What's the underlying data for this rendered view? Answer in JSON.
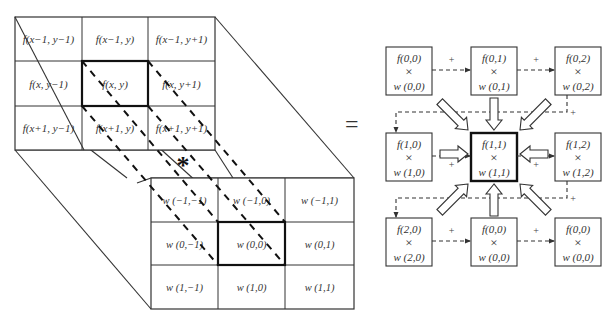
{
  "diagram": {
    "colors": {
      "line": "#333333",
      "text": "#333333",
      "background": "#ffffff"
    },
    "image_grid": {
      "rows": [
        [
          "f(x−1, y−1)",
          "f(x−1, y)",
          "f(x−1, y+1)"
        ],
        [
          "f(x, y−1)",
          "f(x, y)",
          "f(x, y+1)"
        ],
        [
          "f(x+1, y−1)",
          "f(x+1, y)",
          "f(x+1, y+1)"
        ]
      ],
      "highlighted_cell": "f(x, y)"
    },
    "kernel_grid": {
      "rows": [
        [
          "w (−1,−1)",
          "w (−1,0)",
          "w (−1,1)"
        ],
        [
          "w (0,−1)",
          "w (0,0)",
          "w (0,1)"
        ],
        [
          "w (1,−1)",
          "w (1,0)",
          "w (1,1)"
        ]
      ],
      "highlighted_cell": "w (0,0)"
    },
    "operator_symbol": "*",
    "equals_symbol": "=",
    "plus_symbol": "+",
    "times_symbol": "×",
    "product_boxes": [
      {
        "f": "f(0,0)",
        "w": "w (0,0)",
        "center": false
      },
      {
        "f": "f(0,1)",
        "w": "w (0,1)",
        "center": false
      },
      {
        "f": "f(0,2)",
        "w": "w (0,2)",
        "center": false
      },
      {
        "f": "f(1,0)",
        "w": "w (1,0)",
        "center": false
      },
      {
        "f": "f(1,1)",
        "w": "w (1,1)",
        "center": true
      },
      {
        "f": "f(1,2)",
        "w": "w (1,2)",
        "center": false
      },
      {
        "f": "f(2,0)",
        "w": "w (2,0)",
        "center": false
      },
      {
        "f": "f(0,0)",
        "w": "w (0,0)",
        "center": false
      },
      {
        "f": "f(0,0)",
        "w": "w (0,0)",
        "center": false
      }
    ]
  }
}
